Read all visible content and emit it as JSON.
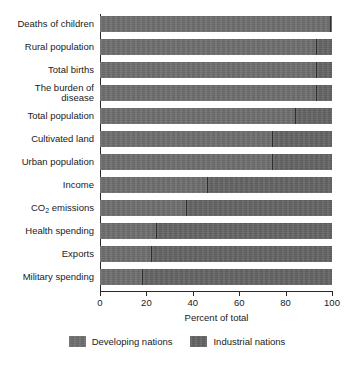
{
  "chart_data": {
    "type": "bar",
    "orientation": "horizontal",
    "stacked": true,
    "normalized_percent": true,
    "title": "",
    "subtitle": "",
    "xlabel": "Percent of total",
    "ylabel": "",
    "xlim": [
      0,
      100
    ],
    "xticks": [
      0,
      20,
      40,
      60,
      80,
      100
    ],
    "xtick_labels": [
      "0",
      "20",
      "40",
      "60",
      "80",
      "100"
    ],
    "grid": false,
    "legend_position": "bottom",
    "categories": [
      "Deaths of children",
      "Rural population",
      "Total births",
      "The burden of disease",
      "Total population",
      "Cultivated land",
      "Urban population",
      "Income",
      "CO2 emissions",
      "Health spending",
      "Exports",
      "Military spending"
    ],
    "category_labels_html": [
      "Deaths of children",
      "Rural population",
      "Total births",
      "The burden of<br>disease",
      "Total population",
      "Cultivated land",
      "Urban population",
      "Income",
      "CO<sub>2</sub> emissions",
      "Health spending",
      "Exports",
      "Military spending"
    ],
    "series": [
      {
        "name": "Developing nations",
        "color": "#6e6e6e",
        "values": [
          99,
          93,
          93,
          93,
          84,
          74,
          74,
          46,
          37,
          24,
          22,
          18
        ]
      },
      {
        "name": "Industrial nations",
        "color": "#636363",
        "values": [
          1,
          7,
          7,
          7,
          16,
          26,
          26,
          54,
          63,
          76,
          78,
          82
        ]
      }
    ]
  },
  "legend": {
    "items": [
      {
        "label": "Developing nations",
        "color": "#6e6e6e"
      },
      {
        "label": "Industrial nations",
        "color": "#636363"
      }
    ]
  },
  "axis": {
    "x_title": "Percent of total"
  }
}
